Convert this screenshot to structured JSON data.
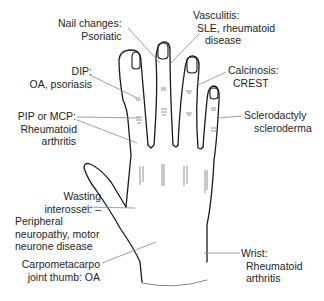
{
  "diagram": {
    "colors": {
      "outline": "#1a1a1a",
      "leader": "#888888",
      "text": "#1e1e1e",
      "crease": "#777777"
    },
    "labels": {
      "nail_changes": {
        "l1": "Nail changes:",
        "l2": "Psoriatic"
      },
      "vasculitis": {
        "l1": "Vasculitis:",
        "l2": "SLE, rheumatoid",
        "l3": "disease"
      },
      "dip": {
        "l1": "DIP:",
        "l2": "OA, psoriasis"
      },
      "calcinosis": {
        "l1": "Calcinosis:",
        "l2": "CREST"
      },
      "pip_mcp": {
        "l1": "PIP or MCP:",
        "l2": "Rheumatoid",
        "l3": "arthritis"
      },
      "sclerodactyly": {
        "l1": "Sclerodactyly",
        "l2": "scleroderma"
      },
      "wasting": {
        "l1": "Wasting",
        "l2": "interossei: –",
        "l3": "Peripheral",
        "l4": "neuropathy, motor",
        "l5": "neurone disease"
      },
      "carpometacarpo": {
        "l1": "Carpometacarpo",
        "l2": "joint thumb: OA"
      },
      "wrist": {
        "l1": "Wrist:",
        "l2": "Rheumatoid",
        "l3": "arthritis"
      }
    }
  }
}
